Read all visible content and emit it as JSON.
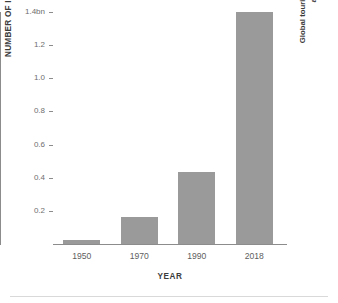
{
  "chart_data": {
    "type": "bar",
    "title": "",
    "categories": [
      "1950",
      "1970",
      "1990",
      "2018"
    ],
    "values": [
      0.025,
      0.166,
      0.435,
      1.4
    ],
    "xlabel": "YEAR",
    "ylabel": "NUMBER OF INTERNATIONAL TOURIST ARRIVALS GLOBALLY",
    "ylim": [
      0,
      1.4
    ],
    "yticks": [
      0.2,
      0.4,
      0.6,
      0.8,
      1.0,
      1.2,
      1.4
    ],
    "ytick_labels": [
      "0.2",
      "0.4",
      "0.6",
      "0.8",
      "1.0",
      "1.2",
      "1.4bn"
    ],
    "grid": false,
    "legend": null,
    "annotations": [
      {
        "text": "Global tourism increased exponentially after World War II",
        "line1": "Global tourism increased exponentially",
        "line2": "after World War II",
        "position": "right-rotated"
      }
    ],
    "bar_color": "#9a9a9a",
    "axis_color": "#8c8c8c",
    "background": "#ffffff"
  }
}
